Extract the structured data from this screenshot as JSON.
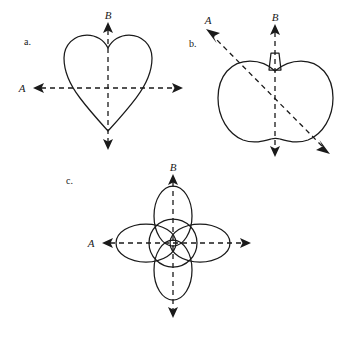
{
  "figure": {
    "background_color": "#ffffff",
    "ink_color": "#1a1a1a",
    "width": 360,
    "height": 341,
    "panels": [
      {
        "id": "a",
        "panel_label": "a.",
        "object_name": "heart",
        "axis_horizontal_label": "A",
        "axis_vertical_label": "B",
        "axis_horizontal_arrowheads": "both",
        "axis_vertical_arrowheads": "both",
        "axis_orientation": "upright",
        "center_x": 108,
        "center_y": 88
      },
      {
        "id": "b",
        "panel_label": "b.",
        "object_name": "apple",
        "axis_horizontal_label": "A",
        "axis_vertical_label": "B",
        "axis_horizontal_arrowheads": "both",
        "axis_vertical_arrowheads": "both",
        "axis_orientation": "tilted",
        "center_x": 272,
        "center_y": 100
      },
      {
        "id": "c",
        "panel_label": "c.",
        "object_name": "four-petal-flower",
        "axis_horizontal_label": "A",
        "axis_vertical_label": "B",
        "axis_horizontal_arrowheads": "both",
        "axis_vertical_arrowheads": "both",
        "axis_orientation": "upright",
        "center_x": 173,
        "center_y": 243
      }
    ]
  },
  "labels": {
    "panel_a_letter": "a.",
    "panel_a_axis_a": "A",
    "panel_a_axis_b": "B",
    "panel_b_letter": "b.",
    "panel_b_axis_a": "A",
    "panel_b_axis_b": "B",
    "panel_c_letter": "c.",
    "panel_c_axis_a": "A",
    "panel_c_axis_b": "B"
  }
}
